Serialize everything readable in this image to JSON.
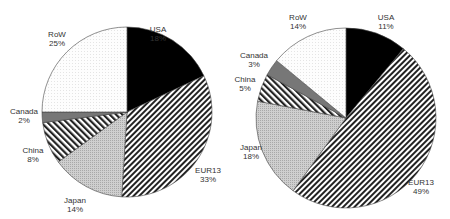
{
  "chart_data": [
    {
      "type": "pie",
      "title": "",
      "categories": [
        "USA",
        "EUR13",
        "Japan",
        "China",
        "Canada",
        "RoW"
      ],
      "values": [
        18,
        33,
        14,
        8,
        2,
        25
      ],
      "labels": [
        "18%",
        "33%",
        "14%",
        "8%",
        "2%",
        "25%"
      ],
      "start_angle_deg": 0,
      "direction": "clockwise",
      "legend": "none (direct labels)"
    },
    {
      "type": "pie",
      "title": "",
      "categories": [
        "USA",
        "EUR13",
        "Japan",
        "China",
        "Canada",
        "RoW"
      ],
      "values": [
        11,
        49,
        18,
        5,
        3,
        14
      ],
      "labels": [
        "11%",
        "49%",
        "18%",
        "5%",
        "3%",
        "14%"
      ],
      "start_angle_deg": 0,
      "direction": "clockwise",
      "legend": "none (direct labels)"
    }
  ],
  "pies": [
    {
      "cx": 127,
      "cy": 112,
      "r": 85,
      "slices": [
        {
          "name": "USA",
          "value": 18,
          "pct": "18%",
          "fill": "#000000",
          "pattern": "solid",
          "lx": 158,
          "ly": 32
        },
        {
          "name": "EUR13",
          "value": 33,
          "pct": "33%",
          "fill": "url(#diagR)",
          "pattern": "diag-right",
          "lx": 208,
          "ly": 173
        },
        {
          "name": "Japan",
          "value": 14,
          "pct": "14%",
          "fill": "url(#dotGrey)",
          "pattern": "light-grey",
          "lx": 75,
          "ly": 203
        },
        {
          "name": "China",
          "value": 8,
          "pct": "8%",
          "fill": "url(#diagL)",
          "pattern": "diag-left",
          "lx": 33,
          "ly": 153
        },
        {
          "name": "Canada",
          "value": 2,
          "pct": "2%",
          "fill": "#777777",
          "pattern": "dark-grey",
          "lx": 24,
          "ly": 114
        },
        {
          "name": "RoW",
          "value": 25,
          "pct": "25%",
          "fill": "url(#dotWhite)",
          "pattern": "white-dotted",
          "lx": 57,
          "ly": 37
        }
      ]
    },
    {
      "cx": 346,
      "cy": 118,
      "r": 90,
      "slices": [
        {
          "name": "USA",
          "value": 11,
          "pct": "11%",
          "fill": "#000000",
          "pattern": "solid",
          "lx": 386,
          "ly": 20
        },
        {
          "name": "EUR13",
          "value": 49,
          "pct": "49%",
          "fill": "url(#diagR)",
          "pattern": "diag-right",
          "lx": 421,
          "ly": 185
        },
        {
          "name": "Japan",
          "value": 18,
          "pct": "18%",
          "fill": "url(#dotGrey)",
          "pattern": "light-grey",
          "lx": 251,
          "ly": 150
        },
        {
          "name": "China",
          "value": 5,
          "pct": "5%",
          "fill": "url(#diagL)",
          "pattern": "diag-left",
          "lx": 245,
          "ly": 82
        },
        {
          "name": "Canada",
          "value": 3,
          "pct": "3%",
          "fill": "#777777",
          "pattern": "dark-grey",
          "lx": 254,
          "ly": 58
        },
        {
          "name": "RoW",
          "value": 14,
          "pct": "14%",
          "fill": "url(#dotWhite)",
          "pattern": "white-dotted",
          "lx": 298,
          "ly": 20
        }
      ]
    }
  ]
}
